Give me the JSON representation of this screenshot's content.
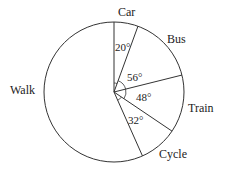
{
  "chart_data": {
    "type": "pie",
    "title": "",
    "unit": "degrees",
    "categories": [
      "Car",
      "Bus",
      "Train",
      "Cycle",
      "Walk"
    ],
    "values": [
      20,
      56,
      48,
      32,
      204
    ],
    "angle_labels": [
      "20°",
      "56°",
      "48°",
      "32°",
      ""
    ],
    "start_angle": "12 o'clock, clockwise",
    "legend": "none (labels outside slices)"
  },
  "labels": {
    "car": "Car",
    "bus": "Bus",
    "train": "Train",
    "cycle": "Cycle",
    "walk": "Walk"
  },
  "angles": {
    "car": "20°",
    "bus": "56°",
    "train": "48°",
    "cycle": "32°"
  },
  "colors": {
    "stroke": "#333333",
    "fill": "#ffffff"
  }
}
